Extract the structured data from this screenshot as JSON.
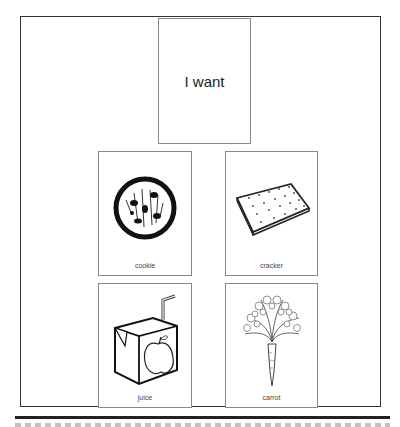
{
  "board": {
    "sentence_starter": "I want",
    "choices": [
      {
        "label": "cookie",
        "icon": "cookie-icon"
      },
      {
        "label": "cracker",
        "icon": "cracker-icon"
      },
      {
        "label": "juice",
        "icon": "juice-box-icon"
      },
      {
        "label": "carrot",
        "icon": "carrot-icon"
      }
    ]
  },
  "colors": {
    "border": "#333333",
    "card_border": "#888888",
    "rule": "#222222"
  }
}
